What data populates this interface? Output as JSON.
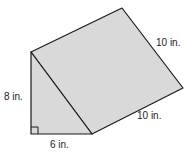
{
  "diagram": {
    "type": "triangular-prism",
    "fill_color": "#d9d9d9",
    "stroke_color": "#1a1a1a",
    "labels": {
      "height": "8 in.",
      "base": "6 in.",
      "length": "10 in.",
      "slant": "10 in."
    },
    "right_angle_marker": true
  }
}
